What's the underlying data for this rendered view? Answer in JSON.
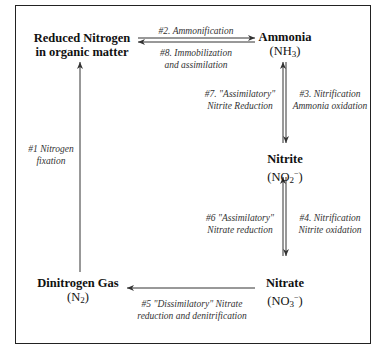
{
  "diagram": {
    "nodes": {
      "organic": {
        "name_line1": "Reduced Nitrogen",
        "name_line2": "in organic matter"
      },
      "ammonia": {
        "name": "Ammonia",
        "formula": "(NH3)"
      },
      "nitrite": {
        "name": "Nitrite",
        "formula": "(NO2−)"
      },
      "nitrate": {
        "name": "Nitrate",
        "formula": "(NO3−)"
      },
      "dinitrogen": {
        "name": "Dinitrogen Gas",
        "formula": "(N2)"
      }
    },
    "processes": {
      "p1": {
        "line1": "#1 Nitrogen",
        "line2": "fixation"
      },
      "p2": {
        "line1": "#2. Ammonification"
      },
      "p3": {
        "line1": "#3. Nitrification",
        "line2": "Ammonia oxidation"
      },
      "p4": {
        "line1": "#4. Nitrification",
        "line2": "Nitrite oxidation"
      },
      "p5": {
        "line1": "#5 \"Dissimilatory\" Nitrate",
        "line2": "reduction and denitrification"
      },
      "p6": {
        "line1": "#6 \"Assimilatory\"",
        "line2": "Nitrate reduction"
      },
      "p7": {
        "line1": "#7. \"Assimilatory\"",
        "line2": "Nitrite Reduction"
      },
      "p8": {
        "line1": "#8. Immobilization",
        "line2": "and assimilation"
      }
    },
    "colors": {
      "line": "#333333",
      "text": "#111111",
      "label": "#333333"
    }
  }
}
